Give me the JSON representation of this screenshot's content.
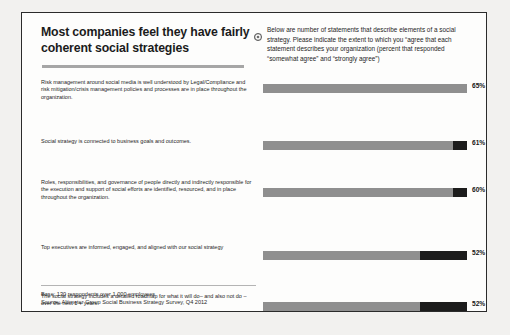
{
  "title": "Most companies feel they have fairly coherent social strategies",
  "intro": {
    "icon": "circle-bullet-icon",
    "text": "Below are number of statements that describe elements of a social strategy. Please indicate the extent to which you “agree that each statement describes your organization (percent that responded “somewhat agree” and “strongly agree”)"
  },
  "footer": {
    "base": "Base: 130 respondents over 1,000 employees",
    "source": "Source: Altimeter Group Social Business Strategy Survey, Q4 2012"
  },
  "colors": {
    "light_segment": "#8f8f8f",
    "dark_segment": "#1c1c1c",
    "title_rule": "#a6a6a6",
    "frame": "#2b2b2b",
    "page_background": "#f2f1ef",
    "slide_background": "#fdfdfc"
  },
  "chart_data": {
    "type": "bar",
    "title": "Most companies feel they have fairly coherent social strategies",
    "subtitle": "Below are number of statements that describe elements of a social strategy. Please indicate the extent to which you “agree that each statement describes your organization (percent that responded “somewhat agree” and “strongly agree”)",
    "xlabel": "",
    "ylabel": "",
    "xlim": [
      0,
      100
    ],
    "grid": false,
    "legend": "none",
    "orientation": "horizontal",
    "value_suffix": "%",
    "categories": [
      "Risk management around social media is well understood by Legal/Compliance and risk mitigation/crisis management policies and processes are in place throughout the organization.",
      "Social strategy is connected to business goals and outcomes.",
      "Roles, responsibilities, and governance of people directly and indirectly responsible for the execution and support of social efforts are identified, resourced, and in place throughout the organization.",
      "Top executives are informed, engaged, and aligned with our social strategy",
      "The social strategy includes a detailed roadmap for what it will do– and also not do – over the next 1 + years",
      "A long-term vision for how social media will improve customer relationships had been articulated.",
      "There are clear metrics used throughout the organization that associate social activities with business outcomes.",
      "Employees at all levels are aware and trained on how to use (or not use) social media in both their jobs as well as personal lives in ways that will positively impact the organization."
    ],
    "values": [
      65,
      61,
      60,
      52,
      52,
      48,
      34,
      27
    ],
    "labels": [
      "65%",
      "61%",
      "60%",
      "52%",
      "52%",
      "48%",
      "34%",
      "27%"
    ],
    "bar_light_fraction": [
      100,
      93,
      93,
      77,
      77,
      65,
      35,
      17
    ]
  },
  "rows": [
    {
      "statement": "Risk management around social media is well understood by Legal/Compliance and risk mitigation/crisis management policies and processes are in place throughout the organization.",
      "label": "65%",
      "light": 100
    },
    {
      "statement": "Social strategy is connected to business goals and outcomes.",
      "label": "61%",
      "light": 93
    },
    {
      "statement": "Roles, responsibilities, and governance of people directly and indirectly responsible for the execution and support of social efforts are identified, resourced, and in place throughout the organization.",
      "label": "60%",
      "light": 93
    },
    {
      "statement": "Top executives are informed, engaged, and aligned with our social strategy",
      "label": "52%",
      "light": 77
    },
    {
      "statement": "The social strategy includes a detailed roadmap for what it will do– and also not do – over the next 1 + years",
      "label": "52%",
      "light": 77
    },
    {
      "statement": "A long-term vision for how social media will improve customer relationships had been articulated.",
      "label": "48%",
      "light": 65
    },
    {
      "statement": "There are clear metrics used throughout the organization that associate social activities with business outcomes.",
      "label": "34%",
      "light": 35
    },
    {
      "statement": "Employees at all levels are aware and trained on how to use (or not use) social media in both their jobs as well as personal lives in ways that will positively impact the organization.",
      "label": "27%",
      "light": 17
    }
  ]
}
